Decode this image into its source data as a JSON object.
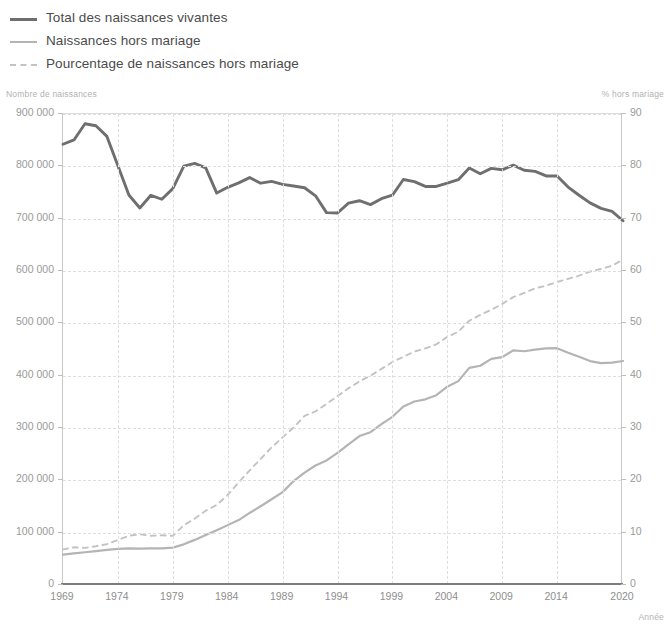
{
  "legend": {
    "items": [
      {
        "label": "Total des naissances vivantes",
        "style": "solid",
        "color": "#6f6f6f",
        "name": "legend-total"
      },
      {
        "label": "Naissances hors mariage",
        "style": "solid-light",
        "color": "#b4b4b4",
        "name": "legend-hors-mariage"
      },
      {
        "label": "Pourcentage de naissances hors mariage",
        "style": "dashed",
        "color": "#c3c3c3",
        "name": "legend-pourcentage"
      }
    ]
  },
  "captions": {
    "left_axis": "Nombre de naissances",
    "right_axis": "% hors mariage",
    "x_axis": "Année"
  },
  "chart_data": {
    "type": "line",
    "title": "",
    "xlabel": "Année",
    "ylabel": "Nombre de naissances",
    "y2label": "% hors mariage",
    "grid": true,
    "legend_position": "top-left",
    "xlim": [
      1969,
      2020
    ],
    "ylim": [
      0,
      900000
    ],
    "y2lim": [
      0,
      90
    ],
    "ytick_labels": [
      "0",
      "100 000",
      "200 000",
      "300 000",
      "400 000",
      "500 000",
      "600 000",
      "700 000",
      "800 000",
      "900 000"
    ],
    "ytick_values": [
      0,
      100000,
      200000,
      300000,
      400000,
      500000,
      600000,
      700000,
      800000,
      900000
    ],
    "y2tick_labels": [
      "0",
      "10",
      "20",
      "30",
      "40",
      "50",
      "60",
      "70",
      "80",
      "90"
    ],
    "y2tick_values": [
      0,
      10,
      20,
      30,
      40,
      50,
      60,
      70,
      80,
      90
    ],
    "xtick_labels": [
      "1969",
      "1974",
      "1979",
      "1984",
      "1989",
      "1994",
      "1999",
      "2004",
      "2009",
      "2014",
      "2020"
    ],
    "xtick_values": [
      1969,
      1974,
      1979,
      1984,
      1989,
      1994,
      1999,
      2004,
      2009,
      2014,
      2020
    ],
    "x": [
      1969,
      1970,
      1971,
      1972,
      1973,
      1974,
      1975,
      1976,
      1977,
      1978,
      1979,
      1980,
      1981,
      1982,
      1983,
      1984,
      1985,
      1986,
      1987,
      1988,
      1989,
      1990,
      1991,
      1992,
      1993,
      1994,
      1995,
      1996,
      1997,
      1998,
      1999,
      2000,
      2001,
      2002,
      2003,
      2004,
      2005,
      2006,
      2007,
      2008,
      2009,
      2010,
      2011,
      2012,
      2013,
      2014,
      2015,
      2016,
      2017,
      2018,
      2019,
      2020
    ],
    "series": [
      {
        "name": "Total des naissances vivantes",
        "axis": "left",
        "style": "solid",
        "color": "#6f6f6f",
        "values": [
          842200,
          850400,
          881300,
          877500,
          857200,
          801200,
          745100,
          720400,
          744700,
          737100,
          757400,
          800400,
          805500,
          797200,
          748900,
          759900,
          768400,
          778500,
          767800,
          771300,
          765500,
          762400,
          759100,
          743700,
          711600,
          710900,
          729600,
          734300,
          726800,
          738100,
          744800,
          774800,
          770900,
          761600,
          761500,
          767800,
          774400,
          796900,
          785900,
          796000,
          793400,
          802200,
          792500,
          790300,
          781600,
          781600,
          760400,
          744700,
          730200,
          719700,
          714000,
          696000
        ]
      },
      {
        "name": "Naissances hors mariage",
        "axis": "left",
        "style": "solid-light",
        "color": "#b4b4b4",
        "values": [
          58000,
          60500,
          62600,
          64600,
          67000,
          69000,
          69900,
          69600,
          70000,
          69900,
          71400,
          77700,
          86200,
          95500,
          104400,
          114400,
          124100,
          137700,
          150500,
          163800,
          177500,
          198600,
          214800,
          228400,
          238100,
          252400,
          268800,
          284600,
          292000,
          307300,
          321400,
          341000,
          350600,
          354800,
          362700,
          379000,
          389600,
          414800,
          419000,
          432000,
          435300,
          448400,
          446700,
          449900,
          452300,
          452500,
          443700,
          436100,
          427900,
          424000,
          425000,
          428000
        ]
      },
      {
        "name": "Pourcentage de naissances hors mariage",
        "axis": "right",
        "style": "dashed",
        "color": "#c3c3c3",
        "values": [
          6.8,
          7.2,
          7.1,
          7.4,
          7.8,
          8.6,
          9.4,
          9.7,
          9.4,
          9.5,
          9.4,
          11.4,
          12.7,
          14.2,
          15.3,
          17.2,
          19.6,
          21.9,
          24.1,
          26.3,
          28.2,
          30.1,
          32.3,
          33.2,
          34.6,
          36.1,
          37.6,
          38.9,
          40.0,
          41.3,
          42.6,
          43.6,
          44.6,
          45.2,
          46.0,
          47.4,
          48.4,
          50.5,
          51.6,
          52.6,
          53.7,
          55.0,
          55.8,
          56.7,
          57.2,
          57.9,
          58.5,
          59.1,
          59.9,
          60.4,
          61.0,
          62.2
        ]
      }
    ]
  }
}
